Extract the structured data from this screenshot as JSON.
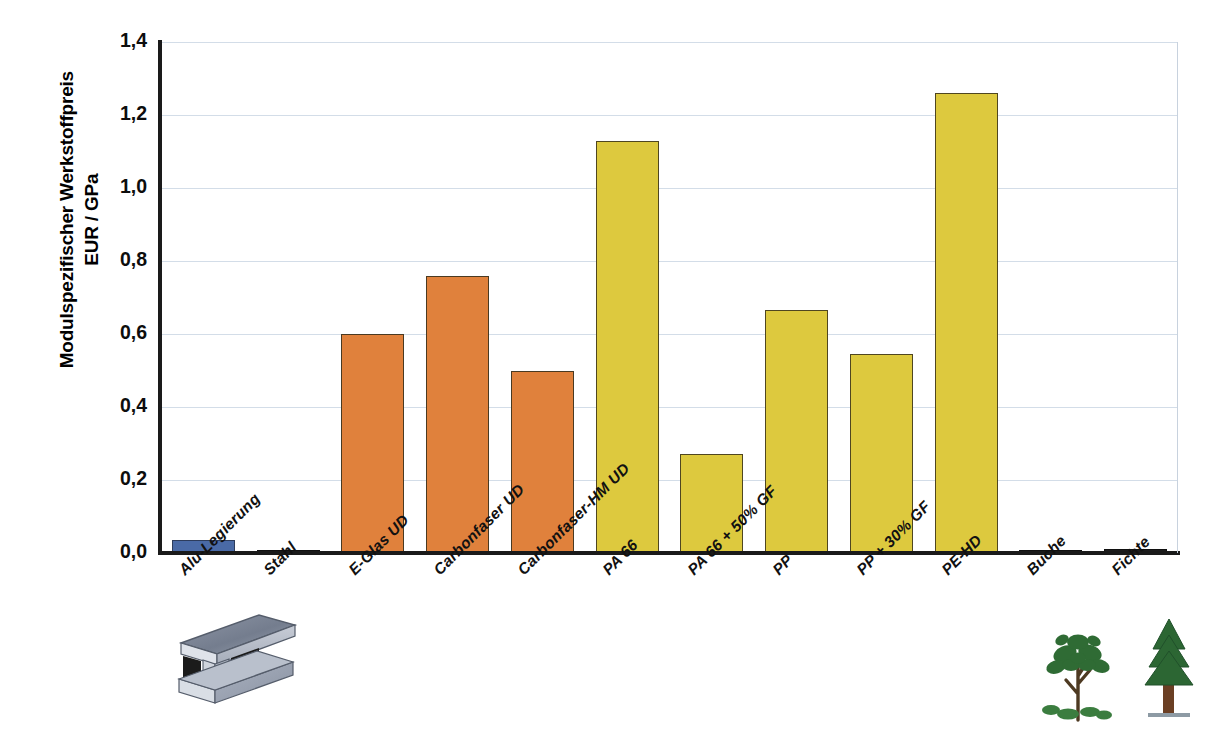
{
  "chart_data": {
    "type": "bar",
    "title": "",
    "xlabel": "",
    "ylabel": "Modulspezifischer Werkstoffpreis EUR / GPa",
    "ylabel_line1": "Modulspezifischer Werkstoffpreis",
    "ylabel_line2": "EUR / GPa",
    "ylim": [
      0.0,
      1.4
    ],
    "ytick_labels": [
      "0,0",
      "0,2",
      "0,4",
      "0,6",
      "0,8",
      "1,0",
      "1,2",
      "1,4"
    ],
    "ytick_values": [
      0.0,
      0.2,
      0.4,
      0.6,
      0.8,
      1.0,
      1.2,
      1.4
    ],
    "grid": true,
    "grid_axis": "y",
    "legend": "none",
    "categories": [
      "Alu-Legierung",
      "Stahl",
      "E-Glas UD",
      "Carbonfaser UD",
      "Carbonfaser-HM UD",
      "PA 66",
      "PA 66 + 50% GF",
      "PP",
      "PP + 30% GF",
      "PE-HD",
      "Buche",
      "Fichte"
    ],
    "values": [
      0.035,
      0.005,
      0.6,
      0.76,
      0.5,
      1.13,
      0.27,
      0.665,
      0.545,
      1.26,
      0.008,
      0.01
    ],
    "bar_colors": [
      "#4a6aa6",
      "#1c1c1c",
      "#e0813c",
      "#e0813c",
      "#e0813c",
      "#ddc93e",
      "#ddc93e",
      "#ddc93e",
      "#ddc93e",
      "#ddc93e",
      "#1c1c1c",
      "#1c1c1c"
    ],
    "colors": {
      "aluminium": "#4a6aa6",
      "fibre_composite": "#e0813c",
      "polymer": "#ddc93e",
      "reference_dark": "#1c1c1c",
      "gridline": "#d3dde8",
      "axis": "#1a1a1a"
    }
  },
  "artwork": [
    {
      "name": "steel-i-beam-illustration",
      "label": "Stahl"
    },
    {
      "name": "beech-tree-illustration",
      "label": "Buche"
    },
    {
      "name": "spruce-tree-illustration",
      "label": "Fichte"
    }
  ]
}
